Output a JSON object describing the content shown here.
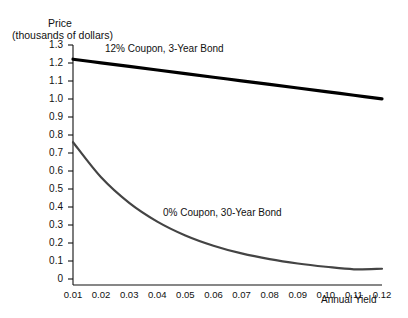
{
  "chart_data": {
    "type": "line",
    "title": "",
    "ylabel": "Price",
    "ylabel_sub": "(thousands of dollars)",
    "xlabel": "Annual Yield",
    "grid": false,
    "legend_position": "inline-annotations",
    "xlim": [
      0.01,
      0.12
    ],
    "ylim": [
      0,
      1.3
    ],
    "x": [
      0.01,
      0.02,
      0.03,
      0.04,
      0.05,
      0.06,
      0.07,
      0.08,
      0.09,
      0.1,
      0.11,
      0.12
    ],
    "xticks": [
      "0.01",
      "0.02",
      "0.03",
      "0.04",
      "0.05",
      "0.06",
      "0.07",
      "0.08",
      "0.09",
      "0.10",
      "0.11",
      "0.12"
    ],
    "yticks": [
      "0",
      "0.1",
      "0.2",
      "0.3",
      "0.4",
      "0.5",
      "0.6",
      "0.7",
      "0.8",
      "0.9",
      "1.0",
      "1.1",
      "1.2",
      "1.3"
    ],
    "ytick_values": [
      0,
      0.1,
      0.2,
      0.3,
      0.4,
      0.5,
      0.6,
      0.7,
      0.8,
      0.9,
      1.0,
      1.1,
      1.2,
      1.3
    ],
    "series": [
      {
        "name": "12% Coupon, 3-Year Bond",
        "color": "#000000",
        "width": 3.2,
        "annotation_text": "12% Coupon, 3-Year Bond",
        "values": [
          1.221,
          1.201,
          1.181,
          1.161,
          1.141,
          1.121,
          1.101,
          1.081,
          1.061,
          1.041,
          1.021,
          1.001
        ]
      },
      {
        "name": "0% Coupon, 30-Year Bond",
        "color": "#444444",
        "width": 2.2,
        "annotation_text": "0% Coupon, 30-Year Bond",
        "values": [
          0.76,
          0.565,
          0.423,
          0.319,
          0.242,
          0.185,
          0.142,
          0.11,
          0.086,
          0.068,
          0.054,
          0.057
        ]
      }
    ]
  }
}
